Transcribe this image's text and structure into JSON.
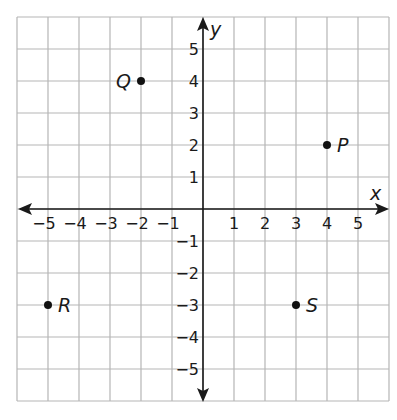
{
  "chart_data": {
    "type": "scatter",
    "title": "",
    "xlabel": "x",
    "ylabel": "y",
    "xlim": [
      -6,
      6
    ],
    "ylim": [
      -6,
      6
    ],
    "grid": true,
    "x_ticks": [
      -5,
      -4,
      -3,
      -2,
      -1,
      1,
      2,
      3,
      4,
      5
    ],
    "y_ticks": [
      -5,
      -4,
      -3,
      -2,
      -1,
      1,
      2,
      3,
      4,
      5
    ],
    "x_tick_labels": [
      "−5",
      "−4",
      "−3",
      "−2",
      "−1",
      "1",
      "2",
      "3",
      "4",
      "5"
    ],
    "y_tick_labels": [
      "−5",
      "−4",
      "−3",
      "−2",
      "−1",
      "1",
      "2",
      "3",
      "4",
      "5"
    ],
    "points": [
      {
        "label": "P",
        "x": 4,
        "y": 2,
        "label_side": "right"
      },
      {
        "label": "Q",
        "x": -2,
        "y": 4,
        "label_side": "left"
      },
      {
        "label": "R",
        "x": -5,
        "y": -3,
        "label_side": "right"
      },
      {
        "label": "S",
        "x": 3,
        "y": -3,
        "label_side": "right"
      }
    ]
  },
  "colors": {
    "grid": "#b5b5b5",
    "axis": "#1a1a1a",
    "point": "#111111"
  }
}
